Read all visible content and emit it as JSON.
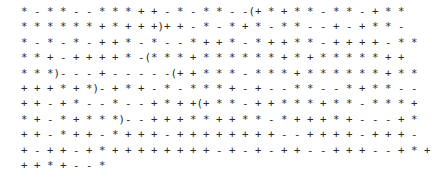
{
  "text_block": {
    "lines": [
      "* - * * - - * * * + + - * - * * - -(+ * + * * - * * - + * *",
      "* * * * * * + * + + +)+ + - * - * + * - * * - - + - + * * -",
      "* - * - * - + + * - * - - * + + * - * + + * * - + + + + - * *",
      "* * + - + + + + * -(* * * + * * * * * * + * + * * * * * + +",
      "* * *)- - - + - - - - -(+ + * * * - * * * + * * * * * * + * *",
      "+ + + * + *)- + * + - * - * * * + - + - - * * - - * + * * - -",
      "+ + - + * - - * - - + * + +(+ * * - + + * * * + * * - * * * +",
      "* + - * + * * *)- - + + + * * + + * * - * + + + * + - - - + *",
      "+ + - * + + - * + + + - + + + + + + + + - - + + + + - + + + -",
      "+ - + + - + * + + + + + + + + - + - + - + + - - + + + - - + * +",
      "+ + * + - - *"
    ]
  }
}
